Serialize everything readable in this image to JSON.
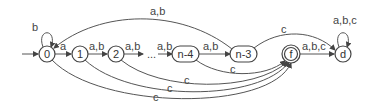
{
  "diagram": {
    "type": "finite-automaton",
    "states": [
      {
        "id": "0",
        "label": "0",
        "initial": true,
        "accepting": false
      },
      {
        "id": "1",
        "label": "1",
        "initial": false,
        "accepting": false
      },
      {
        "id": "2",
        "label": "2",
        "initial": false,
        "accepting": false
      },
      {
        "id": "n-4",
        "label": "n-4",
        "initial": false,
        "accepting": false
      },
      {
        "id": "n-3",
        "label": "n-3",
        "initial": false,
        "accepting": false
      },
      {
        "id": "f",
        "label": "f",
        "initial": false,
        "accepting": true
      },
      {
        "id": "d",
        "label": "d",
        "initial": false,
        "accepting": false
      }
    ],
    "ellipsis": "...",
    "transitions": [
      {
        "from": "0",
        "to": "0",
        "label": "b"
      },
      {
        "from": "0",
        "to": "1",
        "label": "a"
      },
      {
        "from": "1",
        "to": "2",
        "label": "a,b"
      },
      {
        "from": "2",
        "to": "...",
        "label": "a,b"
      },
      {
        "from": "...",
        "to": "n-4",
        "label": "a,b"
      },
      {
        "from": "n-4",
        "to": "n-3",
        "label": "a,b"
      },
      {
        "from": "n-3",
        "to": "0",
        "label": "a,b"
      },
      {
        "from": "n-3",
        "to": "d",
        "label": "c"
      },
      {
        "from": "n-4",
        "to": "f",
        "label": "c"
      },
      {
        "from": "2",
        "to": "f",
        "label": "c"
      },
      {
        "from": "1",
        "to": "f",
        "label": "c"
      },
      {
        "from": "0",
        "to": "f",
        "label": "c"
      },
      {
        "from": "f",
        "to": "d",
        "label": "a,b,c"
      },
      {
        "from": "d",
        "to": "d",
        "label": "a,b,c"
      }
    ]
  }
}
